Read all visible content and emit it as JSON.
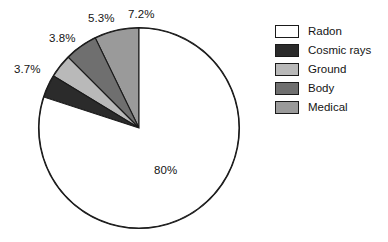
{
  "chart_data": {
    "type": "pie",
    "title": "",
    "subtitle": "",
    "xlabel": "",
    "ylabel": "",
    "legend_position": "right",
    "grid": false,
    "categories": [
      "Radon",
      "Cosmic rays",
      "Ground",
      "Body",
      "Medical"
    ],
    "values": [
      80,
      3.7,
      3.8,
      5.3,
      7.2
    ],
    "slices": [
      {
        "label": "Radon",
        "value": 80,
        "value_text": "80%",
        "color": "#ffffff"
      },
      {
        "label": "Cosmic rays",
        "value": 3.7,
        "value_text": "3.7%",
        "color": "#2b2b2b"
      },
      {
        "label": "Ground",
        "value": 3.8,
        "value_text": "3.8%",
        "color": "#b9b9b9"
      },
      {
        "label": "Body",
        "value": 5.3,
        "value_text": "5.3%",
        "color": "#6f6f6f"
      },
      {
        "label": "Medical",
        "value": 7.2,
        "value_text": "7.2%",
        "color": "#9a9a9a"
      }
    ],
    "data_labels": [
      "80%",
      "3.7%",
      "3.8%",
      "5.3%",
      "7.2%"
    ],
    "legend_entries": [
      "Radon",
      "Cosmic rays",
      "Ground",
      "Body",
      "Medical"
    ]
  },
  "pie": {
    "outline_color": "#1a1a1a",
    "labels": {
      "radon": "80%",
      "cosmic_rays": "3.7%",
      "ground": "3.8%",
      "body": "5.3%",
      "medical": "7.2%"
    }
  },
  "legend": {
    "items": [
      {
        "label": "Radon",
        "color": "#ffffff"
      },
      {
        "label": "Cosmic rays",
        "color": "#2b2b2b"
      },
      {
        "label": "Ground",
        "color": "#b9b9b9"
      },
      {
        "label": "Body",
        "color": "#6f6f6f"
      },
      {
        "label": "Medical",
        "color": "#9a9a9a"
      }
    ]
  }
}
